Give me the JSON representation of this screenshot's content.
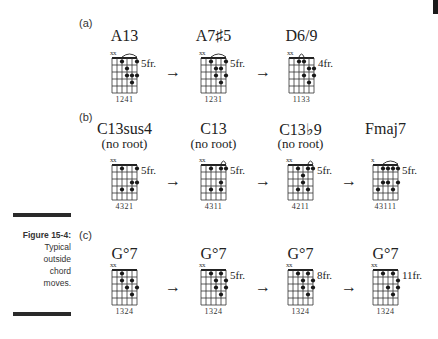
{
  "figure": {
    "number_label": "Figure 15-4:",
    "caption_lines": [
      "Typical",
      "outside",
      "chord",
      "moves."
    ]
  },
  "sections": [
    {
      "label": "(a)",
      "chords": [
        {
          "name": "A13",
          "sub": "",
          "fret": "5fr.",
          "fingering": "1241",
          "muted": "xx",
          "barre": [
            3,
            6
          ],
          "dots": [
            [
              3,
              1
            ],
            [
              6,
              1
            ],
            [
              4,
              2
            ],
            [
              4,
              3
            ],
            [
              5,
              3
            ],
            [
              6,
              3
            ],
            [
              5,
              4
            ]
          ]
        },
        {
          "name": "A7♯5",
          "sub": "",
          "fret": "5fr.",
          "fingering": "1231",
          "muted": "xx",
          "barre": [
            3,
            6
          ],
          "dots": [
            [
              3,
              1
            ],
            [
              6,
              1
            ],
            [
              4,
              2
            ],
            [
              5,
              2
            ],
            [
              4,
              3
            ],
            [
              6,
              3
            ],
            [
              5,
              4
            ]
          ]
        },
        {
          "name": "D6/9",
          "sub": "",
          "fret": "4fr.",
          "fingering": "1133",
          "muted": "xx",
          "barre": [
            3,
            4
          ],
          "dots": [
            [
              3,
              1
            ],
            [
              4,
              1
            ],
            [
              5,
              2
            ],
            [
              6,
              2
            ],
            [
              4,
              3
            ],
            [
              6,
              3
            ],
            [
              5,
              4
            ]
          ]
        }
      ]
    },
    {
      "label": "(b)",
      "chords": [
        {
          "name": "C13sus4",
          "sub": "(no root)",
          "fret": "5fr.",
          "fingering": "4321",
          "muted": "xx",
          "barre": null,
          "dots": [
            [
              3,
              1
            ],
            [
              6,
              1
            ],
            [
              5,
              3
            ],
            [
              6,
              3
            ],
            [
              3,
              4
            ],
            [
              5,
              4
            ]
          ]
        },
        {
          "name": "C13",
          "sub": "(no root)",
          "fret": "5fr.",
          "fingering": "4311",
          "muted": "xx",
          "barre": [
            5,
            6
          ],
          "dots": [
            [
              3,
              1
            ],
            [
              5,
              1
            ],
            [
              6,
              1
            ],
            [
              5,
              3
            ],
            [
              3,
              4
            ],
            [
              5,
              4
            ]
          ]
        },
        {
          "name": "C13♭9",
          "sub": "(no root)",
          "fret": "5fr.",
          "fingering": "4211",
          "muted": "xx",
          "barre": [
            5,
            6
          ],
          "dots": [
            [
              3,
              1
            ],
            [
              5,
              1
            ],
            [
              6,
              1
            ],
            [
              4,
              2
            ],
            [
              4,
              3
            ],
            [
              3,
              4
            ],
            [
              5,
              4
            ]
          ]
        },
        {
          "name": "Fmaj7",
          "sub": "",
          "fret": "5fr.",
          "fingering": "43111",
          "muted": "x",
          "barre": [
            3,
            6
          ],
          "dots": [
            [
              3,
              1
            ],
            [
              4,
              1
            ],
            [
              5,
              1
            ],
            [
              6,
              1
            ],
            [
              3,
              3
            ],
            [
              4,
              3
            ],
            [
              6,
              3
            ],
            [
              2,
              4
            ],
            [
              5,
              4
            ]
          ]
        }
      ]
    },
    {
      "label": "(c)",
      "chords": [
        {
          "name": "G°7",
          "sub": "",
          "fret": "",
          "fingering": "1324",
          "muted": "xx",
          "barre": null,
          "dots": [
            [
              3,
              1
            ],
            [
              3,
              2
            ],
            [
              5,
              2
            ],
            [
              4,
              3
            ],
            [
              6,
              3
            ],
            [
              5,
              4
            ]
          ]
        },
        {
          "name": "G°7",
          "sub": "",
          "fret": "5fr.",
          "fingering": "1324",
          "muted": "xx",
          "barre": null,
          "dots": [
            [
              3,
              1
            ],
            [
              5,
              1
            ],
            [
              4,
              2
            ],
            [
              6,
              2
            ],
            [
              4,
              3
            ],
            [
              6,
              3
            ],
            [
              5,
              4
            ]
          ]
        },
        {
          "name": "G°7",
          "sub": "",
          "fret": "8fr.",
          "fingering": "1324",
          "muted": "xx",
          "barre": null,
          "dots": [
            [
              3,
              1
            ],
            [
              5,
              1
            ],
            [
              4,
              2
            ],
            [
              6,
              2
            ],
            [
              4,
              3
            ],
            [
              6,
              3
            ],
            [
              5,
              4
            ]
          ]
        },
        {
          "name": "G°7",
          "sub": "",
          "fret": "11fr.",
          "fingering": "1324",
          "muted": "xx",
          "barre": null,
          "dots": [
            [
              3,
              1
            ],
            [
              5,
              1
            ],
            [
              6,
              2
            ],
            [
              4,
              3
            ],
            [
              6,
              3
            ],
            [
              5,
              4
            ]
          ]
        }
      ]
    }
  ],
  "arrow_glyph": "→"
}
